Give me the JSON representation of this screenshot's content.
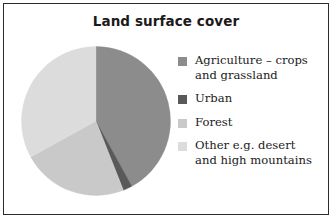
{
  "figure": {
    "title": "Land surface cover",
    "border_color": "#2b2b2b",
    "background": "#ffffff"
  },
  "chart_data": {
    "type": "pie",
    "title": "Land surface cover",
    "xlabel": "",
    "ylabel": "",
    "start_angle_deg": 0,
    "direction": "clockwise",
    "legend_position": "right",
    "grid": false,
    "categories": [
      "Agriculture – crops and grassland",
      "Urban",
      "Forest",
      "Other e.g. desert and high mountains"
    ],
    "values": [
      42,
      2,
      23,
      33
    ],
    "colors": [
      "#8c8c8c",
      "#595959",
      "#c9c9c9",
      "#dcdcdc"
    ],
    "slices": [
      {
        "label": "Agriculture – crops and grassland",
        "value": 42,
        "color": "#8c8c8c",
        "start_deg": 0,
        "end_deg": 151.2
      },
      {
        "label": "Urban",
        "value": 2,
        "color": "#595959",
        "start_deg": 151.2,
        "end_deg": 158.4
      },
      {
        "label": "Forest",
        "value": 23,
        "color": "#c9c9c9",
        "start_deg": 158.4,
        "end_deg": 241.2
      },
      {
        "label": "Other e.g. desert and high mountains",
        "value": 33,
        "color": "#dcdcdc",
        "start_deg": 241.2,
        "end_deg": 360
      }
    ]
  },
  "legend": {
    "items": [
      {
        "label": "Agriculture – crops\nand grassland",
        "color": "#8c8c8c",
        "swatch_name": "legend-swatch-agriculture"
      },
      {
        "label": "Urban",
        "color": "#595959",
        "swatch_name": "legend-swatch-urban"
      },
      {
        "label": "Forest",
        "color": "#c9c9c9",
        "swatch_name": "legend-swatch-forest"
      },
      {
        "label": "Other e.g. desert\nand high mountains",
        "color": "#dcdcdc",
        "swatch_name": "legend-swatch-other"
      }
    ]
  }
}
